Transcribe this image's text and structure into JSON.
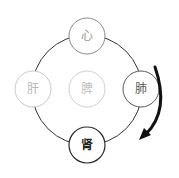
{
  "diagram": {
    "type": "five-organ cycle",
    "nodes": [
      {
        "id": "heart",
        "label": "心",
        "cx": 87,
        "cy": 36,
        "r": 18,
        "stroke": "#8a8a8a",
        "text": "#9a9a9a"
      },
      {
        "id": "liver",
        "label": "肝",
        "cx": 33,
        "cy": 89,
        "r": 18,
        "stroke": "#c8c8c8",
        "text": "#b8b8b8"
      },
      {
        "id": "spleen",
        "label": "脾",
        "cx": 87,
        "cy": 89,
        "r": 18,
        "stroke": "#cfcfcf",
        "text": "#bdbdbd"
      },
      {
        "id": "lung",
        "label": "肺",
        "cx": 141,
        "cy": 89,
        "r": 18,
        "stroke": "#5a5a5a",
        "text": "#555555"
      },
      {
        "id": "kidney",
        "label": "肾",
        "cx": 87,
        "cy": 145,
        "r": 18,
        "stroke": "#2a2a2a",
        "text": "#222222"
      }
    ],
    "ring": {
      "cx": 87,
      "cy": 90,
      "r": 55,
      "stroke": "#333333"
    },
    "arrow": {
      "from": "lung",
      "to": "kidney",
      "color": "#111111"
    }
  }
}
